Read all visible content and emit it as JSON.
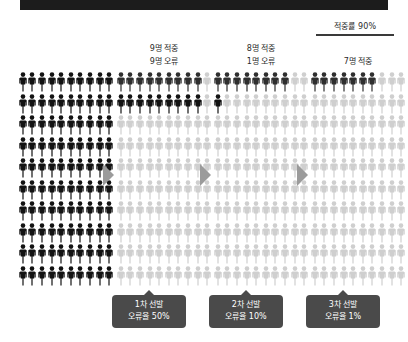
{
  "top_band": {
    "name": "header-band",
    "color": "#1c1c1c"
  },
  "accuracy_callout": {
    "label": "적중률 90%"
  },
  "colors": {
    "active_dark": "#2f2f2f",
    "active_black": "#131313",
    "inactive": "#cfcfcf",
    "arrow": "#9b9b9b",
    "badge_bg": "#4a4a4a",
    "band": "#1c1c1c"
  },
  "columns": [
    {
      "id": "pool",
      "header_lines": [],
      "rows": 10,
      "cols": 10,
      "total": 100,
      "dark_count": 100,
      "black_count": 0,
      "badge": null
    },
    {
      "id": "stage-1",
      "header_lines": [
        "9명 적중",
        "9명 오류"
      ],
      "rows": 10,
      "cols": 10,
      "total": 100,
      "dark_count": 9,
      "black_count": 9,
      "badge": {
        "line1": "1차 선발",
        "line2": "오류율 50%"
      }
    },
    {
      "id": "stage-2",
      "header_lines": [
        "8명 적중",
        "1명 오류"
      ],
      "rows": 10,
      "cols": 10,
      "total": 100,
      "dark_count": 8,
      "black_count": 1,
      "badge": {
        "line1": "2차 선발",
        "line2": "오류율 10%"
      }
    },
    {
      "id": "stage-3",
      "header_lines": [
        "7명 적중"
      ],
      "rows": 10,
      "cols": 10,
      "total": 100,
      "dark_count": 7,
      "black_count": 0,
      "badge": {
        "line1": "3차 선발",
        "line2": "오류율 1%"
      }
    }
  ],
  "arrows": [
    {
      "name": "arrow-pool-to-stage-1"
    },
    {
      "name": "arrow-stage-1-to-stage-2"
    },
    {
      "name": "arrow-stage-2-to-stage-3"
    }
  ],
  "chart_data": {
    "type": "pictogram",
    "title": "적중률 90%",
    "unit_value": 1,
    "unit_label": "명",
    "categories": [
      "전체 후보",
      "1차 선발",
      "2차 선발",
      "3차 선발"
    ],
    "series": [
      {
        "name": "적중",
        "values": [
          100,
          9,
          8,
          7
        ]
      },
      {
        "name": "오류",
        "values": [
          0,
          9,
          1,
          0
        ]
      }
    ],
    "error_rates": [
      null,
      50,
      10,
      1
    ],
    "grid_total_per_column": 100,
    "legend_position": "none",
    "grid": false
  }
}
